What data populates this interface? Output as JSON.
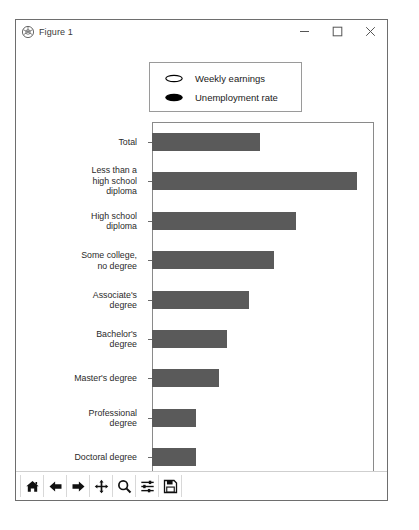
{
  "window": {
    "title": "Figure 1",
    "icon": "matplotlib-icon",
    "minimize_label": "–",
    "maximize_label": "□",
    "close_label": "×"
  },
  "toolbar": {
    "items": [
      {
        "name": "home-icon",
        "tooltip": "Home"
      },
      {
        "name": "back-arrow-icon",
        "tooltip": "Back"
      },
      {
        "name": "forward-arrow-icon",
        "tooltip": "Forward"
      },
      {
        "name": "pan-move-icon",
        "tooltip": "Pan"
      },
      {
        "name": "zoom-magnifier-icon",
        "tooltip": "Zoom"
      },
      {
        "name": "configure-subplots-icon",
        "tooltip": "Configure subplots"
      },
      {
        "name": "save-floppy-icon",
        "tooltip": "Save"
      }
    ]
  },
  "chart_data": {
    "type": "bar",
    "orientation": "horizontal",
    "title": "",
    "xlabel": "Unemployment rate (%)",
    "ylabel": "",
    "xlim": [
      0,
      8
    ],
    "xticks": [
      0,
      2,
      4,
      6,
      8
    ],
    "grid": false,
    "legend_position": "upper center",
    "legend": [
      {
        "label": "Weekly earnings",
        "marker": "ellipse",
        "fill": "#ffffff",
        "edge": "#000000"
      },
      {
        "label": "Unemployment rate",
        "marker": "ellipse",
        "fill": "#000000",
        "edge": "#000000"
      }
    ],
    "bar_color": "#5a5a5a",
    "categories": [
      "Total",
      "Less than a\nhigh school\ndiploma",
      "High school\ndiploma",
      "Some college,\nno degree",
      "Associate's\ndegree",
      "Bachelor's\ndegree",
      "Master's degree",
      "Professional\ndegree",
      "Doctoral degree"
    ],
    "series": [
      {
        "name": "Unemployment rate",
        "values": [
          3.9,
          7.4,
          5.2,
          4.4,
          3.5,
          2.7,
          2.4,
          1.6,
          1.6
        ]
      }
    ]
  }
}
